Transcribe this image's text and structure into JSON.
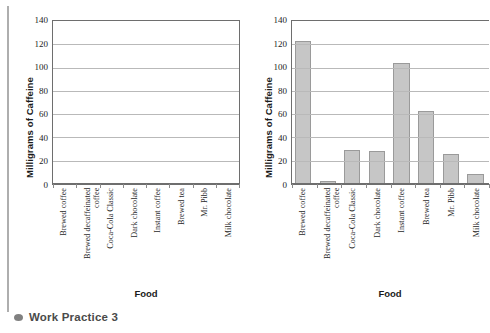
{
  "page": {
    "caption": "Work Practice 3",
    "caption_bullet": "bullet-icon"
  },
  "chart_data": [
    {
      "id": "blank-template",
      "type": "bar",
      "title": "",
      "xlabel": "Food",
      "ylabel": "Milligrams of Caffeine",
      "ylim": [
        0,
        140
      ],
      "yticks": [
        0,
        20,
        40,
        60,
        80,
        100,
        120,
        140
      ],
      "grid": true,
      "legend": "none",
      "categories": [
        "Brewed coffee",
        "Brewed decaffeinated coffee",
        "Coca-Cola Classic",
        "Dark chocolate",
        "Instant coffee",
        "Brewed tea",
        "Mr. Pibb",
        "Milk chocolate"
      ],
      "values": [
        null,
        null,
        null,
        null,
        null,
        null,
        null,
        null
      ]
    },
    {
      "id": "completed-chart",
      "type": "bar",
      "title": "",
      "xlabel": "Food",
      "ylabel": "Milligrams of Caffeine",
      "ylim": [
        0,
        140
      ],
      "yticks": [
        0,
        20,
        40,
        60,
        80,
        100,
        120,
        140
      ],
      "grid": true,
      "legend": "none",
      "bar_color": "#c6c6c6",
      "bar_edge_color": "#9a9a9a",
      "categories": [
        "Brewed coffee",
        "Brewed decaffeinated coffee",
        "Coca-Cola Classic",
        "Dark chocolate",
        "Instant coffee",
        "Brewed tea",
        "Mr. Pibb",
        "Milk chocolate"
      ],
      "values": [
        123,
        3,
        29,
        28,
        104,
        63,
        26,
        9
      ]
    }
  ]
}
